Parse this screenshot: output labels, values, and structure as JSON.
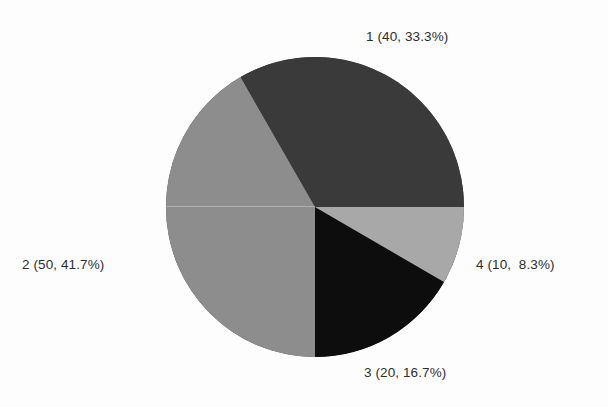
{
  "chart_data": {
    "type": "pie",
    "title": "",
    "xlabel": "",
    "ylabel": "",
    "legend_position": "outside-labels",
    "grid": false,
    "total": 120,
    "start_angle_deg": 0,
    "direction": "counterclockwise",
    "categories": [
      "1",
      "2",
      "3",
      "4"
    ],
    "values": [
      40,
      50,
      20,
      10
    ],
    "percentages": [
      33.3,
      41.7,
      16.7,
      8.3
    ],
    "colors": [
      "#3a3a3a",
      "#8d8d8d",
      "#0d0d0d",
      "#a8a8a8"
    ],
    "labels": [
      "1 (40, 33.3%)",
      "2 (50, 41.7%)",
      "3 (20, 16.7%)",
      "4 (10,  8.3%)"
    ],
    "slices": [
      {
        "category": "1",
        "value": 40,
        "percent": 33.3,
        "color": "#3a3a3a",
        "start_deg": 0,
        "end_deg": 120,
        "label": "1 (40, 33.3%)"
      },
      {
        "category": "2",
        "value": 50,
        "percent": 41.7,
        "color": "#8d8d8d",
        "start_deg": 120,
        "end_deg": 270,
        "label": "2 (50, 41.7%)"
      },
      {
        "category": "3",
        "value": 20,
        "percent": 16.7,
        "color": "#0d0d0d",
        "start_deg": 270,
        "end_deg": 330,
        "label": "3 (20, 16.7%)"
      },
      {
        "category": "4",
        "value": 10,
        "percent": 8.3,
        "color": "#a8a8a8",
        "start_deg": 330,
        "end_deg": 360,
        "label": "4 (10,  8.3%)"
      }
    ],
    "geometry": {
      "center_x": 315,
      "center_y": 207,
      "radius_x": 149,
      "radius_y": 150
    },
    "background": "#fdfdfd"
  }
}
